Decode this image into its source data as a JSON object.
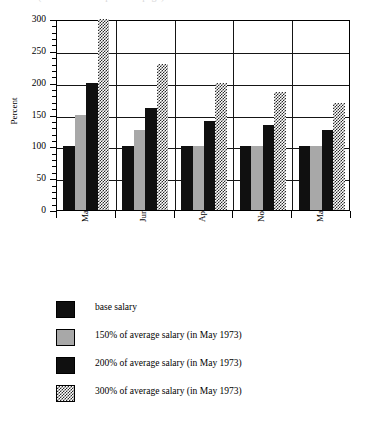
{
  "clipped_title_text": "(continued from previous page)",
  "chart_data": {
    "type": "bar",
    "title": "",
    "xlabel": "",
    "ylabel": "Percent",
    "ylim": [
      0,
      300
    ],
    "ytick_values": [
      0,
      50,
      100,
      150,
      200,
      250,
      300
    ],
    "ytick_labels": [
      "0",
      "50",
      "100",
      "150",
      "200",
      "250",
      "300"
    ],
    "minor_tick_step": 10,
    "grid": "horizontal-and-group-separators",
    "legend_position": "below",
    "categories": [
      "May 1973",
      "June 1973",
      "April 1974",
      "November 1974",
      "March 1975"
    ],
    "series": [
      {
        "name": "base salary",
        "pattern": "solid-black",
        "color": "#101010",
        "values": [
          100,
          100,
          100,
          100,
          100
        ]
      },
      {
        "name": "150% of average salary (in May 1973)",
        "pattern": "solid-gray",
        "color": "#a8a8a8",
        "values": [
          150,
          125,
          100,
          100,
          100
        ]
      },
      {
        "name": "200% of average salary (in May 1973)",
        "pattern": "solid-black",
        "color": "#101010",
        "values": [
          200,
          160,
          140,
          133,
          126
        ]
      },
      {
        "name": "300% of average salary (in May 1973)",
        "pattern": "checkerboard",
        "color": "#2a2a2a",
        "values": [
          300,
          230,
          200,
          185,
          168
        ]
      }
    ]
  },
  "legend": {
    "items": [
      {
        "label": "base salary"
      },
      {
        "label": "150% of average salary (in May 1973)"
      },
      {
        "label": "200% of average salary (in May 1973)"
      },
      {
        "label": "300% of average salary (in May 1973)"
      }
    ]
  }
}
